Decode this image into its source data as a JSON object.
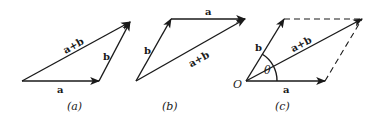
{
  "diagram": {
    "panels": [
      {
        "id": "a",
        "caption": "(a)",
        "vectors": [
          {
            "label": "a",
            "from": [
              22,
              81
            ],
            "to": [
              99,
              81
            ]
          },
          {
            "label": "b",
            "from": [
              99,
              81
            ],
            "to": [
              130,
              22
            ]
          },
          {
            "label": "a+b",
            "from": [
              22,
              81
            ],
            "to": [
              130,
              22
            ]
          }
        ]
      },
      {
        "id": "b",
        "caption": "(b)",
        "vectors": [
          {
            "label": "b",
            "from": [
              136,
              81
            ],
            "to": [
              171,
              19
            ]
          },
          {
            "label": "a",
            "from": [
              171,
              19
            ],
            "to": [
              245,
              19
            ]
          },
          {
            "label": "a+b",
            "from": [
              136,
              81
            ],
            "to": [
              245,
              19
            ]
          }
        ]
      },
      {
        "id": "c",
        "caption": "(c)",
        "origin_label": "O",
        "angle_label": "θ",
        "vectors": [
          {
            "label": "a",
            "from": [
              246,
              81
            ],
            "to": [
              325,
              81
            ]
          },
          {
            "label": "b",
            "from": [
              246,
              81
            ],
            "to": [
              284,
              19
            ]
          },
          {
            "label": "a+b",
            "from": [
              246,
              81
            ],
            "to": [
              362,
              19
            ]
          }
        ],
        "dashed_edges": [
          {
            "from": [
              284,
              19
            ],
            "to": [
              362,
              19
            ]
          },
          {
            "from": [
              325,
              81
            ],
            "to": [
              362,
              19
            ]
          }
        ]
      }
    ],
    "labels": {
      "pa_a": "a",
      "pa_b": "b",
      "pa_ab": "a+b",
      "pa_cap": "(a)",
      "pb_a": "a",
      "pb_b": "b",
      "pb_ab": "a+b",
      "pb_cap": "(b)",
      "pc_a": "a",
      "pc_b": "b",
      "pc_ab": "a+b",
      "pc_cap": "(c)",
      "pc_O": "O",
      "pc_theta": "θ"
    }
  }
}
